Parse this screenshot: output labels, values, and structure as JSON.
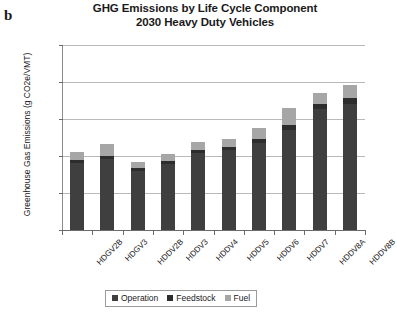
{
  "panel_letter": "b",
  "title": {
    "line1": "GHG Emissions by Life Cycle Component",
    "line2": "2030 Heavy Duty Vehicles"
  },
  "axes": {
    "y_axis_title": "Greenhouse Gas Emissions (g CO2e/VMT)",
    "y_ticks": [
      "2500",
      "2000",
      "1500",
      "1000",
      "500",
      "0"
    ]
  },
  "legend": {
    "items": [
      {
        "label": "Operation",
        "color": "#3f3f3f"
      },
      {
        "label": "Feedstock",
        "color": "#2d2d2d"
      },
      {
        "label": "Fuel",
        "color": "#a6a6a6"
      }
    ]
  },
  "chart_data": {
    "type": "bar",
    "subtype": "stacked-vertical",
    "title": "GHG Emissions by Life Cycle Component 2030 Heavy Duty Vehicles",
    "xlabel": "",
    "ylabel": "Greenhouse Gas Emissions (g CO2e/VMT)",
    "ylim": [
      0,
      2500
    ],
    "ytick_interval": 500,
    "grid": true,
    "legend_position": "bottom",
    "categories": [
      "HDGV2B",
      "HDGV3",
      "HDDV2B",
      "HDDV3",
      "HDDV4",
      "HDDV5",
      "HDDV6",
      "HDDV7",
      "HDDV8A",
      "HDDV8B"
    ],
    "series": [
      {
        "name": "Operation",
        "color": "#3f3f3f",
        "values": [
          905,
          960,
          800,
          890,
          1035,
          1075,
          1180,
          1355,
          1630,
          1700
        ]
      },
      {
        "name": "Feedstock",
        "color": "#2d2d2d",
        "values": [
          35,
          35,
          40,
          40,
          45,
          50,
          55,
          65,
          75,
          80
        ]
      },
      {
        "name": "Fuel",
        "color": "#a6a6a6",
        "values": [
          120,
          165,
          85,
          100,
          105,
          100,
          140,
          230,
          145,
          175
        ]
      }
    ],
    "totals": [
      1060,
      1160,
      925,
      1030,
      1185,
      1225,
      1375,
      1650,
      1850,
      1955
    ]
  }
}
